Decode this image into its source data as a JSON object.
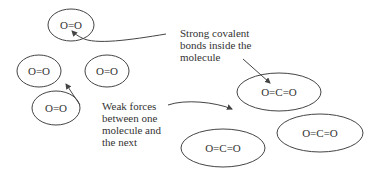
{
  "molecules": [
    {
      "formula": "O=O"
    },
    {
      "formula": "O=O"
    },
    {
      "formula": "O=O"
    },
    {
      "formula": "O=O"
    },
    {
      "formula": "O=C=O"
    },
    {
      "formula": "O=C=O"
    },
    {
      "formula": "O=C=O"
    }
  ],
  "labels": {
    "covalent": [
      "Strong covalent",
      "bonds inside the",
      "molecule"
    ],
    "weak": [
      "Weak forces",
      "between one",
      "molecule and",
      "the next"
    ]
  }
}
